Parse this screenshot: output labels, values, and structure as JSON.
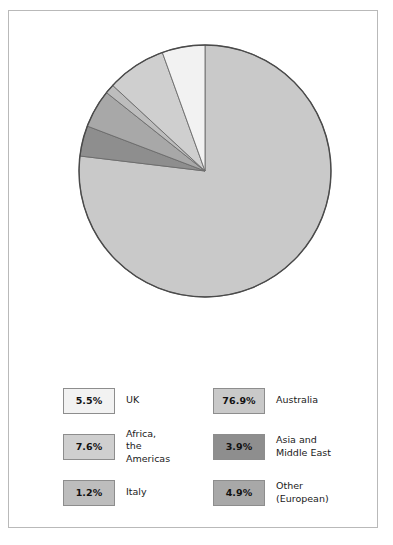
{
  "chart_data": {
    "type": "pie",
    "title": "",
    "categories": [
      "Australia",
      "Asia and Middle East",
      "Other (European)",
      "Italy",
      "Africa, the Americas",
      "UK"
    ],
    "values": [
      76.9,
      3.9,
      4.9,
      1.2,
      7.6,
      5.5
    ],
    "value_labels": [
      "76.9%",
      "3.9%",
      "4.9%",
      "1.2%",
      "7.6%",
      "5.5%"
    ],
    "unit": "percent",
    "start_angle_deg": 0,
    "direction": "clockwise",
    "legend_position": "bottom",
    "grid": false,
    "slices": [
      {
        "label": "Australia",
        "value": 76.9,
        "value_label": "76.9%",
        "color": "#c9c9c9"
      },
      {
        "label": "Asia and Middle East",
        "value": 3.9,
        "value_label": "3.9%",
        "color": "#8e8e8e"
      },
      {
        "label": "Other (European)",
        "value": 4.9,
        "value_label": "4.9%",
        "color": "#a8a8a8"
      },
      {
        "label": "Italy",
        "value": 1.2,
        "value_label": "1.2%",
        "color": "#bdbdbd"
      },
      {
        "label": "Africa, the Americas",
        "value": 7.6,
        "value_label": "7.6%",
        "color": "#cfcfcf"
      },
      {
        "label": "UK",
        "value": 5.5,
        "value_label": "5.5%",
        "color": "#f2f2f2"
      }
    ]
  },
  "pie": {
    "outline_color": "#4a4a4a",
    "center_x": 134,
    "center_y": 142,
    "radius": 126
  },
  "legend": {
    "entries": [
      {
        "value_label": "5.5%",
        "label": "UK",
        "color": "#f2f2f2"
      },
      {
        "value_label": "76.9%",
        "label": "Australia",
        "color": "#c9c9c9"
      },
      {
        "value_label": "7.6%",
        "label": "Africa,\nthe Americas",
        "color": "#cfcfcf"
      },
      {
        "value_label": "3.9%",
        "label": "Asia and\nMiddle East",
        "color": "#8e8e8e"
      },
      {
        "value_label": "1.2%",
        "label": "Italy",
        "color": "#bdbdbd"
      },
      {
        "value_label": "4.9%",
        "label": "Other\n(European)",
        "color": "#a8a8a8"
      }
    ]
  }
}
